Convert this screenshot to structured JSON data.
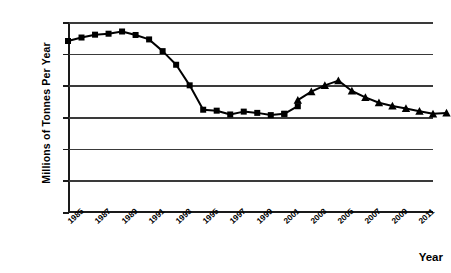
{
  "chart_data": {
    "type": "line",
    "title": "",
    "xlabel": "Year",
    "ylabel": "Millions of Tonnes Per Year",
    "xlim": [
      1985,
      2012
    ],
    "ylim": [
      0,
      600
    ],
    "ytick_labels": [
      "600",
      "500",
      "400",
      "300",
      "200",
      "100",
      "0"
    ],
    "ytick_values": [
      600,
      500,
      400,
      300,
      200,
      100,
      0
    ],
    "xtick_labels": [
      "1985",
      "1987",
      "1989",
      "1991",
      "1993",
      "1995",
      "1997",
      "1999",
      "2001",
      "2003",
      "2005",
      "2007",
      "2009",
      "2011"
    ],
    "xtick_values": [
      1985,
      1987,
      1989,
      1991,
      1993,
      1995,
      1997,
      1999,
      2001,
      2003,
      2005,
      2007,
      2009,
      2011
    ],
    "grid": "horizontal",
    "legend": "none",
    "series": [
      {
        "name": "Historical (square markers)",
        "marker": "square",
        "color": "#000000",
        "x": [
          1985,
          1986,
          1987,
          1988,
          1989,
          1990,
          1991,
          1992,
          1993,
          1994,
          1995,
          1996,
          1997,
          1998,
          1999,
          2000,
          2001
        ],
        "values": [
          540,
          551,
          560,
          563,
          570,
          559,
          545,
          508,
          465,
          400,
          323,
          320,
          308,
          317,
          313,
          306,
          310
        ]
      },
      {
        "name": "Historical continued (square markers)",
        "marker": "square",
        "color": "#000000",
        "x": [
          2001,
          2002
        ],
        "values": [
          310,
          334
        ]
      },
      {
        "name": "Projection (triangle markers)",
        "marker": "triangle",
        "color": "#000000",
        "x": [
          2002,
          2003,
          2004,
          2005,
          2006,
          2007,
          2008,
          2009,
          2010,
          2011,
          2012,
          2013
        ],
        "values": [
          353,
          380,
          400,
          415,
          382,
          362,
          345,
          335,
          327,
          318,
          310,
          313
        ]
      }
    ]
  },
  "axes": {
    "y_title": "Millions of Tonnes Per Year",
    "x_title": "Year"
  }
}
